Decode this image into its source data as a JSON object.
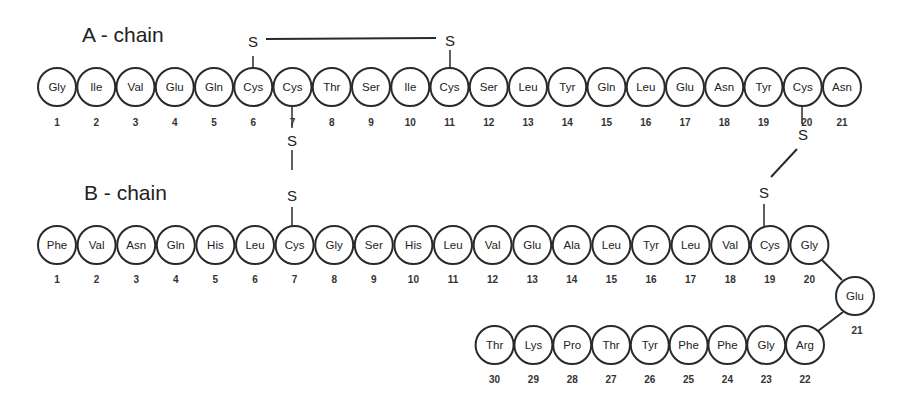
{
  "a_chain": {
    "title": "A - chain",
    "residues": [
      "Gly",
      "Ile",
      "Val",
      "Glu",
      "Gln",
      "Cys",
      "Cys",
      "Thr",
      "Ser",
      "Ile",
      "Cys",
      "Ser",
      "Leu",
      "Tyr",
      "Gln",
      "Leu",
      "Glu",
      "Asn",
      "Tyr",
      "Cys",
      "Asn"
    ],
    "numbers": [
      "1",
      "2",
      "3",
      "4",
      "5",
      "6",
      "7",
      "8",
      "9",
      "10",
      "11",
      "12",
      "13",
      "14",
      "15",
      "16",
      "17",
      "18",
      "19",
      "20",
      "21"
    ]
  },
  "b_chain": {
    "title": "B - chain",
    "residues": [
      "Phe",
      "Val",
      "Asn",
      "Gln",
      "His",
      "Leu",
      "Cys",
      "Gly",
      "Ser",
      "His",
      "Leu",
      "Val",
      "Glu",
      "Ala",
      "Leu",
      "Tyr",
      "Leu",
      "Val",
      "Cys",
      "Gly",
      "Glu",
      "Arg",
      "Gly",
      "Phe",
      "Phe",
      "Tyr",
      "Thr",
      "Pro",
      "Lys",
      "Thr"
    ],
    "numbers": [
      "1",
      "2",
      "3",
      "4",
      "5",
      "6",
      "7",
      "8",
      "9",
      "10",
      "11",
      "12",
      "13",
      "14",
      "15",
      "16",
      "17",
      "18",
      "19",
      "20",
      "21",
      "22",
      "23",
      "24",
      "25",
      "26",
      "27",
      "28",
      "29",
      "30"
    ]
  },
  "disulfide_bonds": [
    {
      "from": "A6",
      "to": "A11",
      "labels": [
        "S",
        "S"
      ],
      "type": "intra-chain"
    },
    {
      "from": "A7",
      "to": "B7",
      "labels": [
        "S",
        "S"
      ],
      "type": "inter-chain"
    },
    {
      "from": "A20",
      "to": "B19",
      "labels": [
        "S",
        "S"
      ],
      "type": "inter-chain"
    }
  ],
  "colors": {
    "stroke": "#2a2a2a",
    "text": "#222222",
    "background": "#ffffff"
  }
}
